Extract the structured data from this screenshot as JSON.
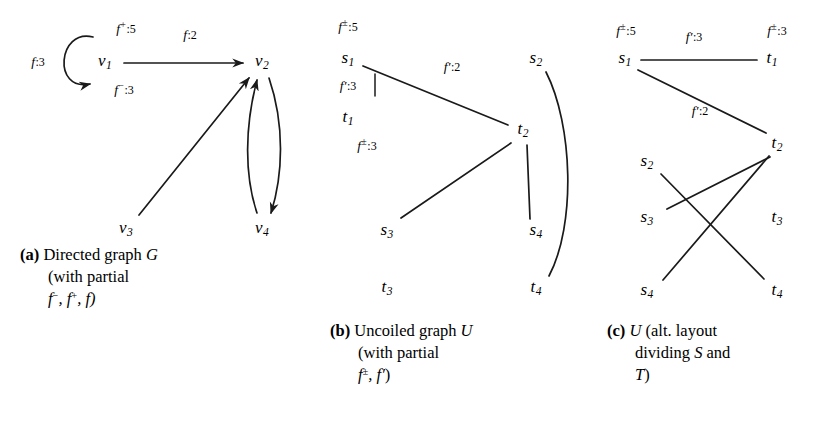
{
  "figure": {
    "background": "#ffffff",
    "ink": "#1a1a1a",
    "width": 825,
    "height": 430
  },
  "panels": [
    {
      "id": "a",
      "tag": "(a)",
      "caption_lines": [
        "Directed graph G",
        "(with partial",
        "f−, f+, f)"
      ],
      "caption_line1_text": "Directed graph ",
      "caption_line1_math": "G",
      "caption_line2": "(with partial",
      "caption_line3_prefix": "f",
      "caption_line3_sup1": "−",
      "caption_line3_mid": ", f",
      "caption_line3_sup2": "+",
      "caption_line3_end": ", f)",
      "nodes": [
        {
          "name": "v1",
          "base": "v",
          "sub": "1",
          "x": 105,
          "y": 62
        },
        {
          "name": "v2",
          "base": "v",
          "sub": "2",
          "x": 262,
          "y": 62
        },
        {
          "name": "v3",
          "base": "v",
          "sub": "3",
          "x": 126,
          "y": 229
        },
        {
          "name": "v4",
          "base": "v",
          "sub": "4",
          "x": 262,
          "y": 229
        }
      ],
      "edges": [
        {
          "name": "loop-v1",
          "from": "v1",
          "to": "v1",
          "kind": "self-loop",
          "directed": true
        },
        {
          "name": "v1-v2",
          "from": "v1",
          "to": "v2",
          "kind": "straight",
          "directed": true
        },
        {
          "name": "v3-v2",
          "from": "v3",
          "to": "v2",
          "kind": "straight",
          "directed": true
        },
        {
          "name": "v2-v4",
          "from": "v2",
          "to": "v4",
          "kind": "curve-right",
          "directed": true
        },
        {
          "name": "v4-v2",
          "from": "v4",
          "to": "v2",
          "kind": "curve-left",
          "directed": true
        }
      ],
      "labels": [
        {
          "name": "label-f-3-loop",
          "base": "f",
          "sup": "",
          "value": ":3",
          "x": 38,
          "y": 62
        },
        {
          "name": "label-fplus-5",
          "base": "f",
          "sup": "+",
          "value": ":5",
          "x": 126,
          "y": 28
        },
        {
          "name": "label-fminus-3",
          "base": "f",
          "sup": "−",
          "value": ":3",
          "x": 124,
          "y": 89
        },
        {
          "name": "label-f-2",
          "base": "f",
          "sup": "",
          "value": ":2",
          "x": 190,
          "y": 35
        }
      ]
    },
    {
      "id": "b",
      "tag": "(b)",
      "caption_line1_text": "Uncoiled graph ",
      "caption_line1_math": "U",
      "caption_line2": "(with partial",
      "caption_line3_prefix": "f",
      "caption_line3_sup1": "±",
      "caption_line3_mid": ", f",
      "caption_line3_prime": "′",
      "caption_line3_end": ")",
      "nodes": [
        {
          "name": "s1",
          "base": "s",
          "sub": "1",
          "x": 348,
          "y": 59
        },
        {
          "name": "s2",
          "base": "s",
          "sub": "2",
          "x": 536,
          "y": 59
        },
        {
          "name": "t1",
          "base": "t",
          "sub": "1",
          "x": 348,
          "y": 118
        },
        {
          "name": "t2",
          "base": "t",
          "sub": "2",
          "x": 523,
          "y": 130
        },
        {
          "name": "s3",
          "base": "s",
          "sub": "3",
          "x": 387,
          "y": 231
        },
        {
          "name": "s4",
          "base": "s",
          "sub": "4",
          "x": 536,
          "y": 231
        },
        {
          "name": "t3",
          "base": "t",
          "sub": "3",
          "x": 387,
          "y": 288
        },
        {
          "name": "t4",
          "base": "t",
          "sub": "4",
          "x": 536,
          "y": 288
        }
      ],
      "edges": [
        {
          "name": "s1-t1",
          "from": "s1",
          "to": "t1",
          "kind": "vertical-tick"
        },
        {
          "name": "s1-t2",
          "from": "s1",
          "to": "t2",
          "kind": "straight"
        },
        {
          "name": "s3-t2",
          "from": "s3",
          "to": "t2",
          "kind": "straight"
        },
        {
          "name": "s4-t2",
          "from": "s4",
          "to": "t2",
          "kind": "straight"
        },
        {
          "name": "s2-t4",
          "from": "s2",
          "to": "t4",
          "kind": "curve"
        }
      ],
      "labels": [
        {
          "name": "label-fpm-5",
          "base": "f",
          "sup": "±",
          "value": ":5",
          "x": 348,
          "y": 26
        },
        {
          "name": "label-fprime-3",
          "base": "f",
          "prime": true,
          "value": ":3",
          "x": 348,
          "y": 86
        },
        {
          "name": "label-fpm-3",
          "base": "f",
          "sup": "±",
          "value": ":3",
          "x": 367,
          "y": 145
        },
        {
          "name": "label-fprime-2",
          "base": "f",
          "prime": true,
          "value": ":2",
          "x": 452,
          "y": 67
        }
      ]
    },
    {
      "id": "c",
      "tag": "(c)",
      "caption_line1_math": "U",
      "caption_line1_text": " (alt. layout",
      "caption_line2": "dividing S and",
      "caption_line3": "T)",
      "nodes": [
        {
          "name": "s1",
          "base": "s",
          "sub": "1",
          "x": 625,
          "y": 59
        },
        {
          "name": "t1",
          "base": "t",
          "sub": "1",
          "x": 772,
          "y": 59
        },
        {
          "name": "s2",
          "base": "s",
          "sub": "2",
          "x": 647,
          "y": 162
        },
        {
          "name": "t2",
          "base": "t",
          "sub": "2",
          "x": 777,
          "y": 144
        },
        {
          "name": "s3",
          "base": "s",
          "sub": "3",
          "x": 647,
          "y": 218
        },
        {
          "name": "t3",
          "base": "t",
          "sub": "3",
          "x": 777,
          "y": 218
        },
        {
          "name": "s4",
          "base": "s",
          "sub": "4",
          "x": 647,
          "y": 291
        },
        {
          "name": "t4",
          "base": "t",
          "sub": "4",
          "x": 777,
          "y": 291
        }
      ],
      "edges": [
        {
          "name": "s1-t1",
          "from": "s1",
          "to": "t1",
          "kind": "straight"
        },
        {
          "name": "s1-t2",
          "from": "s1",
          "to": "t2",
          "kind": "straight"
        },
        {
          "name": "s2-t4",
          "from": "s2",
          "to": "t4",
          "kind": "straight"
        },
        {
          "name": "s3-t2",
          "from": "s3",
          "to": "t2",
          "kind": "straight"
        },
        {
          "name": "s4-t2",
          "from": "s4",
          "to": "t2",
          "kind": "straight"
        }
      ],
      "labels": [
        {
          "name": "label-fpm-5",
          "base": "f",
          "sup": "±",
          "value": ":5",
          "x": 626,
          "y": 30
        },
        {
          "name": "label-fprime-3",
          "base": "f",
          "prime": true,
          "value": ":3",
          "x": 694,
          "y": 37
        },
        {
          "name": "label-fpm-3",
          "base": "f",
          "sup": "±",
          "value": ":3",
          "x": 777,
          "y": 30
        },
        {
          "name": "label-fprime-2",
          "base": "f",
          "prime": true,
          "value": ":2",
          "x": 700,
          "y": 111
        }
      ]
    }
  ]
}
